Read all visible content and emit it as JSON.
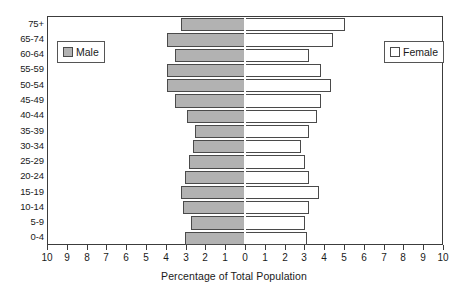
{
  "chart_data": {
    "type": "bar",
    "subtype": "population-pyramid",
    "title": "",
    "xlabel": "Percentage of Total Population",
    "ylabel": "",
    "categories": [
      "0-4",
      "5-9",
      "10-14",
      "15-19",
      "20-24",
      "25-29",
      "30-34",
      "35-39",
      "40-44",
      "45-49",
      "50-54",
      "55-59",
      "60-64",
      "65-74",
      "75+"
    ],
    "series": [
      {
        "name": "Male",
        "side": "left",
        "color": "#b2b2b2",
        "values": [
          3.0,
          2.7,
          3.1,
          3.2,
          3.0,
          2.8,
          2.6,
          2.5,
          2.9,
          3.5,
          3.9,
          3.9,
          3.5,
          3.9,
          3.2
        ]
      },
      {
        "name": "Female",
        "side": "right",
        "color": "#ffffff",
        "values": [
          3.1,
          3.0,
          3.2,
          3.7,
          3.2,
          3.0,
          2.8,
          3.2,
          3.6,
          3.8,
          4.3,
          3.8,
          3.2,
          4.4,
          5.0
        ]
      }
    ],
    "x_ticks_left": [
      10,
      9,
      8,
      7,
      6,
      5,
      4,
      3,
      2,
      1
    ],
    "x_tick_center": 0,
    "x_ticks_right": [
      1,
      2,
      3,
      4,
      5,
      6,
      7,
      8,
      9,
      10
    ],
    "x_tick_labels": [
      "10",
      "9",
      "8",
      "7",
      "6",
      "5",
      "4",
      "3",
      "2",
      "1",
      "0",
      "1",
      "2",
      "3",
      "4",
      "5",
      "6",
      "7",
      "8",
      "9",
      "10"
    ],
    "xlim": [
      -10,
      10
    ],
    "grid": false,
    "legend_position": "inside-top-left-and-top-right"
  },
  "axis": {
    "x_title": "Percentage of Total Population"
  },
  "legend": {
    "male": {
      "label": "Male",
      "swatch": "filled-gray-square"
    },
    "female": {
      "label": "Female",
      "swatch": "empty-white-square"
    }
  }
}
